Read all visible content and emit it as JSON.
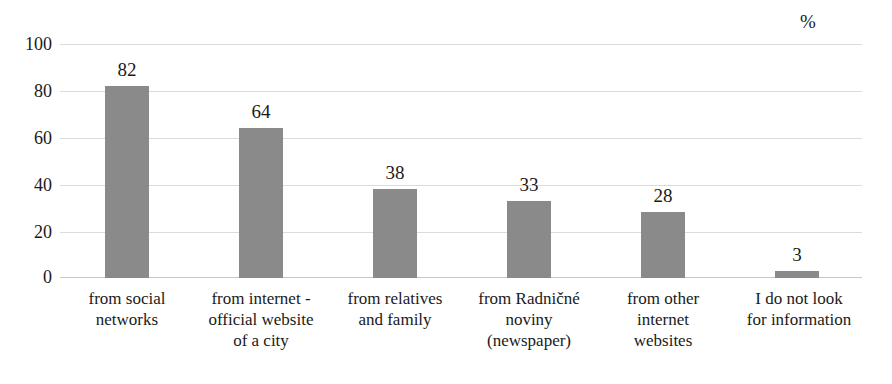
{
  "chart_data": {
    "type": "bar",
    "title": "",
    "subtitle": "",
    "xlabel": "",
    "ylabel": "",
    "unit_label": "%",
    "ylim": [
      0,
      100
    ],
    "yticks": [
      100,
      80,
      60,
      40,
      20,
      0
    ],
    "grid": true,
    "legend": "none",
    "orientation": "vertical",
    "categories": [
      "from social\nnetworks",
      "from internet -\nofficial website\nof a city",
      "from relatives\nand family",
      "from Radničné\nnoviny\n(newspaper)",
      "from other\ninternet\nwebsites",
      "I do not look\nfor information"
    ],
    "values": [
      82,
      64,
      38,
      33,
      28,
      3
    ],
    "value_labels": [
      "82",
      "64",
      "38",
      "33",
      "28",
      "3"
    ],
    "series": [
      {
        "name": "share of respondents",
        "values": [
          82,
          64,
          38,
          33,
          28,
          3
        ]
      }
    ],
    "colors": {
      "bar_fill": "#8a8a8a",
      "gridline": "#d9dcdf",
      "baseline": "#c4c8cc",
      "text": "#1a1a1a",
      "background": "#ffffff"
    }
  }
}
